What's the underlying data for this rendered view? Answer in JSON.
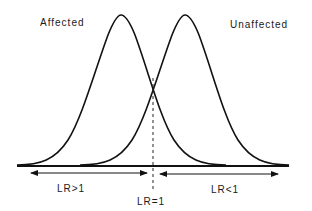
{
  "diagram": {
    "curves": [
      {
        "name": "Affected",
        "label": "Affected",
        "peak_x": 121,
        "peak_y": 15
      },
      {
        "name": "Unaffected",
        "label": "Unaffected",
        "peak_x": 185,
        "peak_y": 15
      }
    ],
    "threshold": {
      "label": "LR=1"
    },
    "regions": [
      {
        "label": "LR>1",
        "side": "left"
      },
      {
        "label": "LR<1",
        "side": "right"
      }
    ],
    "colors": {
      "line": "#111111",
      "background": "#ffffff"
    }
  }
}
